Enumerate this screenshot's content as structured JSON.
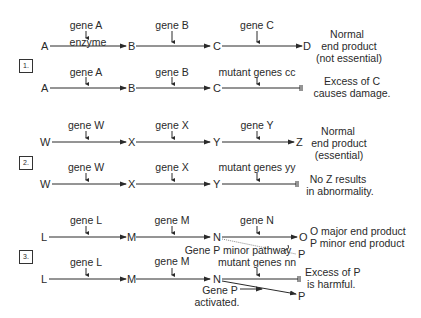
{
  "sections": [
    {
      "number": "1.",
      "normal": {
        "nodes": [
          "A",
          "B",
          "C",
          "D"
        ],
        "genes": [
          "gene A",
          "gene B",
          "gene C"
        ],
        "enzyme_label": "enzyme",
        "outcome": [
          "Normal",
          "end product",
          "(not essential)"
        ]
      },
      "mutant": {
        "nodes": [
          "A",
          "B",
          "C"
        ],
        "genes": [
          "gene A",
          "gene B",
          "mutant genes cc"
        ],
        "outcome": [
          "Excess of C",
          "causes damage."
        ]
      }
    },
    {
      "number": "2.",
      "normal": {
        "nodes": [
          "W",
          "X",
          "Y",
          "Z"
        ],
        "genes": [
          "gene W",
          "gene X",
          "gene Y"
        ],
        "outcome": [
          "Normal",
          "end product",
          "(essential)"
        ]
      },
      "mutant": {
        "nodes": [
          "W",
          "X",
          "Y"
        ],
        "genes": [
          "gene W",
          "gene X",
          "mutant genes yy"
        ],
        "outcome": [
          "No Z results",
          "in abnormality."
        ]
      }
    },
    {
      "number": "3.",
      "normal": {
        "nodes": [
          "L",
          "M",
          "N",
          "O",
          "P"
        ],
        "genes": [
          "gene L",
          "gene M",
          "gene N"
        ],
        "minor_pathway_label": "Gene P minor pathway",
        "outcome": [
          "O major end product",
          "P minor end product"
        ]
      },
      "mutant": {
        "nodes": [
          "L",
          "M",
          "N",
          "P"
        ],
        "genes": [
          "gene L",
          "gene M",
          "mutant genes nn"
        ],
        "activated_label": [
          "Gene P",
          "activated."
        ],
        "outcome": [
          "Excess of P",
          "is harmful."
        ]
      }
    }
  ]
}
